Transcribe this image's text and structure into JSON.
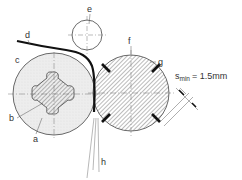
{
  "diagram": {
    "labels": {
      "a": "a",
      "b": "b",
      "c": "c",
      "d": "d",
      "e": "e",
      "f": "f",
      "g": "g",
      "h": "h"
    },
    "dimension": {
      "symbol": "s",
      "subscript": "min",
      "value": "= 1.5mm"
    },
    "colors": {
      "line": "#333333",
      "hatch": "#555555",
      "fill_light": "#ececec",
      "strip": "#111111"
    }
  }
}
